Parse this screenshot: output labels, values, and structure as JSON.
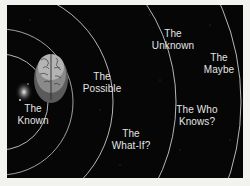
{
  "diagram": {
    "type": "concentric-rings",
    "colors": {
      "background": "#060606",
      "frame": "#f2f2ee",
      "ring": "#c8c8c8",
      "label": "#e4e4e4"
    },
    "center_icon": "brain-icon",
    "decoration_icon": "galaxy-icon",
    "rings": [
      {
        "label": "The\nKnown",
        "x": 33,
        "y": 110
      },
      {
        "label": "The\nPossible",
        "x": 102,
        "y": 71
      },
      {
        "label": "The\nUnknown",
        "x": 173,
        "y": 28
      },
      {
        "label": "The\nMaybe",
        "x": 219,
        "y": 52
      },
      {
        "label": "The Who\nKnows?",
        "x": 197,
        "y": 104
      },
      {
        "label": "The\nWhat-If?",
        "x": 131,
        "y": 128
      }
    ]
  }
}
